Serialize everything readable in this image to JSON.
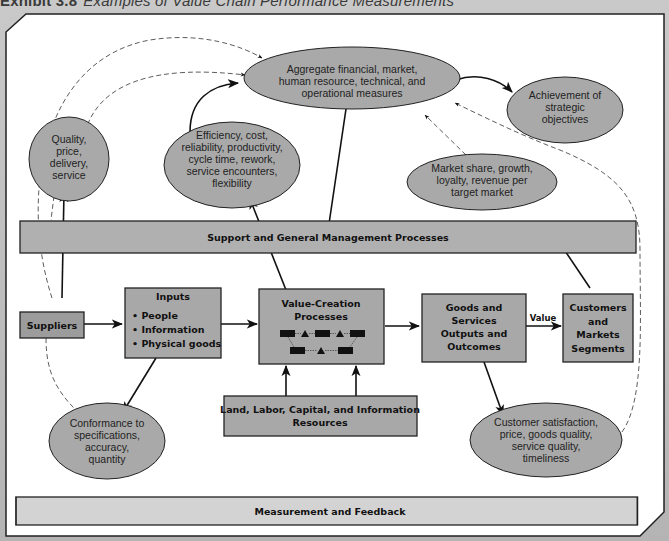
{
  "exhibit": {
    "number": "Exhibit 3.8",
    "title": "Examples of Value Chain Performance Measurements"
  },
  "colors": {
    "page_bg": "#b9b9b9",
    "canvas_bg": "#ffffff",
    "ellipse_fill": "#a9a9a9",
    "box_fill": "#a8a8a8",
    "bar_fill": "#b0b0b0",
    "feedback_bar_fill": "#d3d3d3",
    "stroke": "#1a1a1a"
  },
  "ellipses": {
    "aggregate": {
      "lines": [
        "Aggregate financial, market,",
        "human resource, technical, and",
        "operational measures"
      ]
    },
    "strategic": {
      "lines": [
        "Achievement of",
        "strategic",
        "objectives"
      ]
    },
    "quality": {
      "lines": [
        "Quality,",
        "price,",
        "delivery,",
        "service"
      ]
    },
    "efficiency": {
      "lines": [
        "Efficiency, cost,",
        "reliability, productivity,",
        "cycle time, rework,",
        "service encounters,",
        "flexibility"
      ]
    },
    "market": {
      "lines": [
        "Market share, growth,",
        "loyalty, revenue per",
        "target market"
      ]
    },
    "conformance": {
      "lines": [
        "Conformance to",
        "specifications,",
        "accuracy,",
        "quantity"
      ]
    },
    "customer": {
      "lines": [
        "Customer satisfaction,",
        "price, goods quality,",
        "service quality,",
        "timeliness"
      ]
    }
  },
  "bars": {
    "support": "Support and General Management Processes",
    "feedback": "Measurement and Feedback"
  },
  "boxes": {
    "suppliers": {
      "lines": [
        "Suppliers"
      ]
    },
    "inputs": {
      "title": "Inputs",
      "bullets": [
        "People",
        "Information",
        "Physical goods"
      ],
      "bullet_char": "•"
    },
    "value_creation": {
      "lines": [
        "Value-Creation",
        "Processes"
      ]
    },
    "goods": {
      "lines": [
        "Goods and",
        "Services",
        "Outputs and",
        "Outcomes"
      ]
    },
    "customers": {
      "lines": [
        "Customers",
        "and",
        "Markets",
        "Segments"
      ]
    },
    "resources": {
      "lines": [
        "Land, Labor, Capital, and Information",
        "Resources"
      ]
    }
  },
  "arrow_labels": {
    "value": "Value"
  }
}
